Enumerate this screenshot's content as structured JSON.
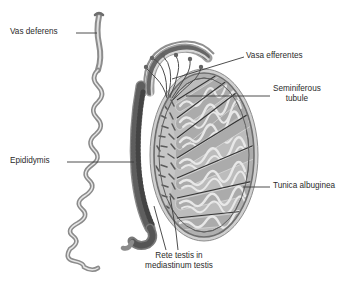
{
  "figure": {
    "background": "#ffffff",
    "ink": "#2b2b2b"
  },
  "palette": {
    "outline": "#4a4a4a",
    "tunica_outer": "#9a9a9a",
    "tunica_inner": "#bdbdbd",
    "lobule_fill": "#a8a8a8",
    "tubule_line": "#e3e3e3",
    "septum": "#3c3c3c",
    "mediastinum": "#c3c3c3",
    "rete_dash": "#5d5d5d",
    "epididymis_granular": "#6f6f6f",
    "duct_line": "#6a6a6a",
    "leader": "#3a3a3a"
  },
  "labels": [
    {
      "id": "vas-deferens",
      "text": "Vas deferens",
      "x": 10,
      "y": 28,
      "align": "left",
      "leader": [
        [
          76,
          33
        ],
        [
          97,
          33
        ]
      ]
    },
    {
      "id": "epididymis",
      "text": "Epididymis",
      "x": 10,
      "y": 157,
      "align": "left",
      "leader": [
        [
          67,
          162
        ],
        [
          134,
          162
        ]
      ]
    },
    {
      "id": "vasa-efferentes",
      "text": "Vasa efferentes",
      "x": 246,
      "y": 52,
      "align": "left",
      "leader": [
        [
          244,
          57
        ],
        [
          172,
          79
        ]
      ]
    },
    {
      "id": "seminiferous-tubule",
      "text": "Seminiferous",
      "text2": "tubule",
      "x": 273,
      "y": 85,
      "align": "center",
      "leader": [
        [
          270,
          96
        ],
        [
          186,
          96
        ]
      ]
    },
    {
      "id": "tunica-albuginea",
      "text": "Tunica albuginea",
      "x": 273,
      "y": 182,
      "align": "left",
      "leader": [
        [
          270,
          187
        ],
        [
          243,
          187
        ]
      ]
    },
    {
      "id": "rete-testis",
      "text": "Rete testis in",
      "text2": "mediastinum testis",
      "x": 152,
      "y": 253,
      "align": "center",
      "leader": [
        [
          178,
          250
        ],
        [
          170,
          196
        ]
      ]
    }
  ],
  "structures": {
    "testis": {
      "name": "testis",
      "center_x": 204,
      "center_y": 155,
      "radius_x": 54,
      "radius_y": 86
    },
    "lobule_count": 7,
    "rete_dash_count": 34,
    "epididymis_segments": "head, body, tail",
    "vas_deferens": "coiled convoluted duct ascending to upper left"
  }
}
